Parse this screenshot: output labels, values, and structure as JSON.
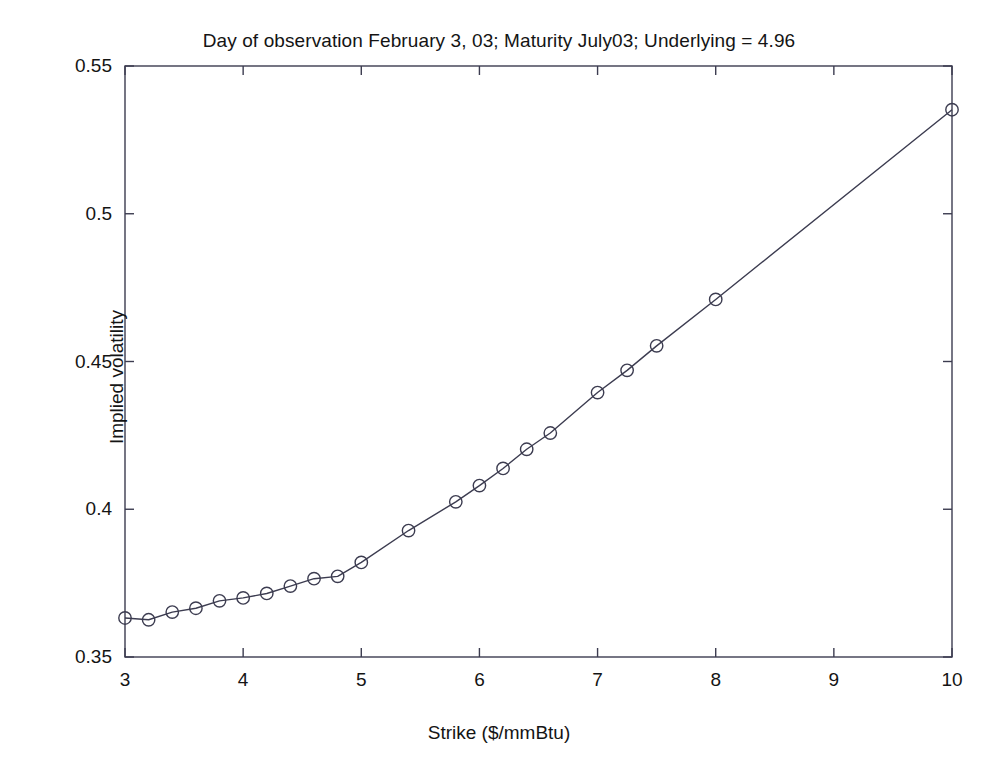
{
  "figure": {
    "background_color": "#ffffff",
    "line_color": "#3c3c50",
    "text_color": "#141414"
  },
  "chart_data": {
    "type": "line",
    "title": "Day of observation February 3, 03; Maturity July03; Underlying = 4.96",
    "xlabel": "Strike ($/mmBtu)",
    "ylabel": "Implied volatility",
    "xlim": [
      3,
      10
    ],
    "ylim": [
      0.35,
      0.55
    ],
    "xticks": [
      3,
      4,
      5,
      6,
      7,
      8,
      9,
      10
    ],
    "xtick_labels": [
      "3",
      "4",
      "5",
      "6",
      "7",
      "8",
      "9",
      "10"
    ],
    "yticks": [
      0.35,
      0.4,
      0.45,
      0.5,
      0.55
    ],
    "ytick_labels": [
      "0.35",
      "0.4",
      "0.45",
      "0.5",
      "0.55"
    ],
    "grid": false,
    "legend": null,
    "marker": "circle-open",
    "series": [
      {
        "name": "Implied volatility",
        "x": [
          3.0,
          3.2,
          3.4,
          3.6,
          3.8,
          4.0,
          4.2,
          4.4,
          4.6,
          4.8,
          5.0,
          5.4,
          5.8,
          6.0,
          6.2,
          6.4,
          6.6,
          7.0,
          7.25,
          7.5,
          8.0,
          10.0
        ],
        "y": [
          0.3632,
          0.3626,
          0.3652,
          0.3665,
          0.369,
          0.37,
          0.3715,
          0.374,
          0.3765,
          0.3773,
          0.382,
          0.3928,
          0.4025,
          0.408,
          0.4138,
          0.4203,
          0.4258,
          0.4395,
          0.447,
          0.4553,
          0.471,
          0.5352
        ]
      }
    ]
  }
}
